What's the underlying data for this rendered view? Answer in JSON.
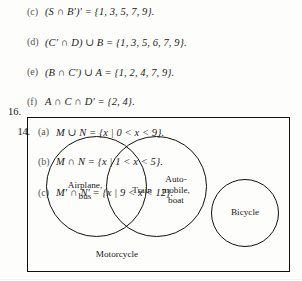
{
  "page": {
    "width": 302,
    "height": 281,
    "ink_color": "#1a1a1a",
    "paper_color": "#fdfdfb"
  },
  "answers": [
    {
      "number": "",
      "sub": "(c)",
      "indent": "lvl-a",
      "text": "(S ∩ B′)′ = {1, 3, 5, 7, 9}."
    },
    {
      "number": "",
      "sub": "(d)",
      "indent": "lvl-a",
      "text": "(C′ ∩ D) ∪ B = {1, 3, 5, 6, 7, 9}."
    },
    {
      "number": "",
      "sub": "(e)",
      "indent": "lvl-a",
      "text": "(B ∩ C′) ∪ A = {1, 2, 4, 7, 9}."
    },
    {
      "number": "",
      "sub": "(f)",
      "indent": "lvl-a",
      "text": "A ∩ C ∩ D′ = {2, 4}."
    },
    {
      "number": "14.",
      "sub": "(a)",
      "indent": "lvl-b",
      "text": "M ∪ N = {x | 0 < x < 9}."
    },
    {
      "number": "",
      "sub": "(b)",
      "indent": "lvl-b",
      "text": "M ∩ N = {x | 1 < x < 5}."
    },
    {
      "number": "",
      "sub": "(c)",
      "indent": "lvl-b",
      "text": "M′ ∩ N′ = {x | 9 < x < 12}."
    }
  ],
  "venn": {
    "number": "16.",
    "universe_label": "Motorcycle",
    "sets": [
      {
        "name": "set-airplane-bus",
        "label_line1": "Airplane,",
        "label_line2": "bus"
      },
      {
        "name": "set-intersection-train",
        "label_line1": "Train",
        "label_line2": ""
      },
      {
        "name": "set-automobile-boat",
        "label_line1": "Auto-",
        "label_line2": "mobile,",
        "label_line3": "boat"
      },
      {
        "name": "set-bicycle",
        "label_line1": "Bicycle",
        "label_line2": ""
      }
    ]
  }
}
